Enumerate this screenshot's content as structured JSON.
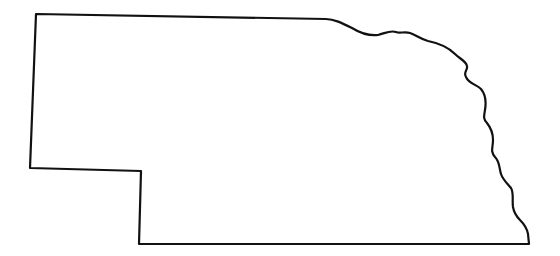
{
  "map": {
    "region": "Nebraska",
    "style": "state outline",
    "stroke_color": "#111111",
    "fill_color": "#ffffff",
    "background": "#ffffff",
    "outline_path": "M36,14 L326,19 C334,19 342,23 352,28 C360,33 368,36 378,35 C386,33 390,30 396,32 C400,34 404,31 410,33 C416,35 420,39 428,41 C438,43 448,47 455,54 C460,59 466,61 467,66 C468,70 463,72 466,77 C469,84 476,84 481,89 C486,95 486,104 485,110 C484,116 483,119 487,123 C491,128 493,132 493,140 C493,148 490,151 495,157 C500,162 499,168 501,174 C503,180 507,183 511,188 C514,193 512,200 513,207 C514,213 516,216 520,220 C524,224 527,228 528,234 L529,244 L139,244 L141,171 L30,168 Z"
  }
}
